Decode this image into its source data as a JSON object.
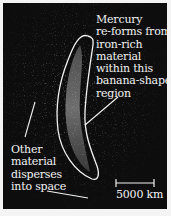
{
  "figure": {
    "annotations": {
      "mercury_label": "Mercury\nre-forms from\niron-rich\nmaterial\nwithin this\nbanana-shaped\nregion",
      "other_label": "Other\nmaterial\ndisperses\ninto space"
    },
    "scale_bar": {
      "label": "5000 km"
    },
    "colors": {
      "background": "#0d0d0d",
      "outline": "#f2f2f2",
      "text": "#f2f2f2"
    }
  }
}
